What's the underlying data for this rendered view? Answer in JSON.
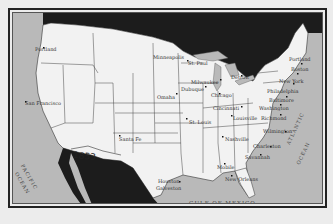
{
  "map": {
    "title": "United States (1853)",
    "colors": {
      "background": "#ececec",
      "land": "#f2f2f2",
      "water": "#b9b9b9",
      "foreign_land": "#1c1c1c",
      "border": "#222222"
    },
    "annotations": {
      "year": "1853",
      "pacific": "PACIFIC OCEAN",
      "pacific_word1": "PACIFIC",
      "pacific_word2": "OCEAN",
      "atlantic_word1": "ATLANTIC",
      "atlantic_word2": "OCEAN",
      "gulf": "GULF OF MEXICO"
    },
    "cities": [
      {
        "name": "Portland",
        "x": 34,
        "y": 45
      },
      {
        "name": "San Francisco",
        "x": 24,
        "y": 99
      },
      {
        "name": "Minneapolis",
        "x": 152,
        "y": 52
      },
      {
        "name": "St. Paul",
        "x": 185,
        "y": 58
      },
      {
        "name": "Omaha",
        "x": 152,
        "y": 90
      },
      {
        "name": "Milwaukee",
        "x": 188,
        "y": 77
      },
      {
        "name": "Dubuque",
        "x": 180,
        "y": 83
      },
      {
        "name": "Chicago",
        "x": 207,
        "y": 90
      },
      {
        "name": "Detroit",
        "x": 226,
        "y": 72
      },
      {
        "name": "Cincinnati",
        "x": 212,
        "y": 103
      },
      {
        "name": "St. Louis",
        "x": 186,
        "y": 116
      },
      {
        "name": "Louisville",
        "x": 227,
        "y": 113
      },
      {
        "name": "Richmond",
        "x": 258,
        "y": 113
      },
      {
        "name": "Washington",
        "x": 256,
        "y": 102
      },
      {
        "name": "Baltimore",
        "x": 261,
        "y": 94
      },
      {
        "name": "Philadelphia",
        "x": 262,
        "y": 84
      },
      {
        "name": "New York",
        "x": 272,
        "y": 75
      },
      {
        "name": "Boston",
        "x": 287,
        "y": 63
      },
      {
        "name": "Portland",
        "x": 284,
        "y": 53
      },
      {
        "name": "Nashville",
        "x": 222,
        "y": 133
      },
      {
        "name": "Wilmington",
        "x": 256,
        "y": 125
      },
      {
        "name": "Charleston",
        "x": 248,
        "y": 140
      },
      {
        "name": "Savannah",
        "x": 240,
        "y": 151
      },
      {
        "name": "Mobile",
        "x": 222,
        "y": 162
      },
      {
        "name": "New Orleans",
        "x": 212,
        "y": 172
      },
      {
        "name": "Santa Fe",
        "x": 116,
        "y": 135
      },
      {
        "name": "Houston",
        "x": 155,
        "y": 175
      },
      {
        "name": "Galveston",
        "x": 153,
        "y": 182
      }
    ]
  }
}
